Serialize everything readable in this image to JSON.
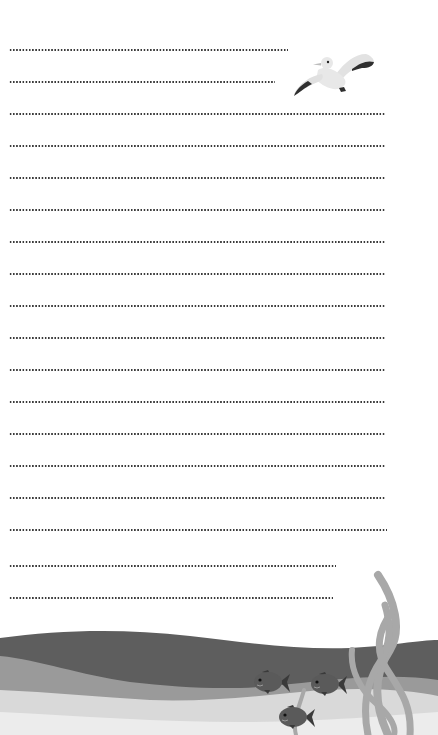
{
  "page": {
    "type": "lined-stationery",
    "background": "#ffffff",
    "line_style": "dotted",
    "line_color": "#3a3a3a",
    "lines": [
      {
        "y": 50,
        "x_end": 288
      },
      {
        "y": 82,
        "x_end": 275
      },
      {
        "y": 114,
        "x_end": 386
      },
      {
        "y": 146,
        "x_end": 386
      },
      {
        "y": 178,
        "x_end": 386
      },
      {
        "y": 210,
        "x_end": 386
      },
      {
        "y": 242,
        "x_end": 386
      },
      {
        "y": 274,
        "x_end": 386
      },
      {
        "y": 306,
        "x_end": 386
      },
      {
        "y": 338,
        "x_end": 386
      },
      {
        "y": 370,
        "x_end": 386
      },
      {
        "y": 402,
        "x_end": 386
      },
      {
        "y": 434,
        "x_end": 386
      },
      {
        "y": 466,
        "x_end": 386
      },
      {
        "y": 498,
        "x_end": 386
      },
      {
        "y": 530,
        "x_end": 387
      },
      {
        "y": 566,
        "x_end": 336
      },
      {
        "y": 598,
        "x_end": 333
      }
    ]
  },
  "illustrations": {
    "seagull": {
      "icon": "seagull-icon",
      "x": 293,
      "y": 52
    },
    "sea": {
      "dark_wave_color": "#5e5e5e",
      "mid_wave_color": "#9a9a9a",
      "light_wave_color": "#d9d9d9",
      "sand_color": "#ececec",
      "seaweed_color": "#a8a8a8"
    },
    "fish": [
      {
        "icon": "fish-icon",
        "x": 254,
        "y": 670
      },
      {
        "icon": "fish-icon",
        "x": 311,
        "y": 672
      },
      {
        "icon": "fish-icon",
        "x": 279,
        "y": 705
      }
    ]
  }
}
